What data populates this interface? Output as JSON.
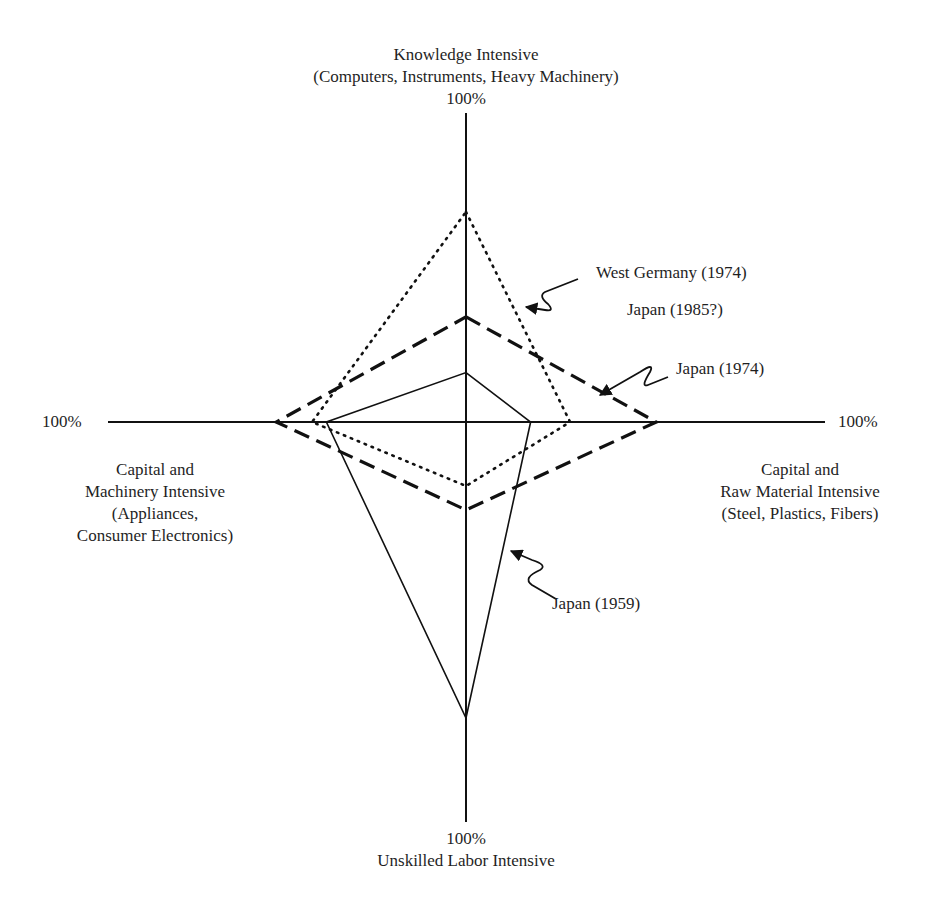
{
  "chart_data": {
    "type": "radar",
    "title": "",
    "axes": [
      {
        "key": "top",
        "name": "Knowledge Intensive",
        "sub": "(Computers, Instruments, Heavy Machinery)",
        "max_label": "100%"
      },
      {
        "key": "right",
        "name": "Capital and Raw Material Intensive",
        "lines": [
          "Capital and",
          "Raw Material Intensive",
          "(Steel, Plastics, Fibers)"
        ],
        "max_label": "100%"
      },
      {
        "key": "bottom",
        "name": "Unskilled Labor Intensive",
        "max_label": "100%"
      },
      {
        "key": "left",
        "name": "Capital and Machinery Intensive",
        "lines": [
          "Capital and",
          "Machinery Intensive",
          "(Appliances,",
          "Consumer Electronics)"
        ],
        "max_label": "100%"
      }
    ],
    "scale": "percent of axis length (0 at center, 100% at axis end)",
    "series": [
      {
        "name": "West Germany (1974) / Japan (1985?)",
        "style": "dotted",
        "values": {
          "top": 68,
          "right": 29,
          "bottom": 16,
          "left": 43
        }
      },
      {
        "name": "Japan (1974)",
        "style": "dashed",
        "values": {
          "top": 34,
          "right": 53,
          "bottom": 22,
          "left": 53
        }
      },
      {
        "name": "Japan (1959)",
        "style": "solid",
        "values": {
          "top": 16,
          "right": 18,
          "bottom": 74,
          "left": 39
        }
      }
    ],
    "annotations": [
      {
        "text": "West Germany (1974)",
        "target_series": 0
      },
      {
        "text": "Japan (1985?)",
        "target_series": 0
      },
      {
        "text": "Japan (1974)",
        "target_series": 1
      },
      {
        "text": "Japan (1959)",
        "target_series": 2
      }
    ],
    "grid": false,
    "legend": "none (callout arrows)"
  },
  "labels": {
    "top_title": "Knowledge Intensive",
    "top_sub": "(Computers, Instruments, Heavy Machinery)",
    "top_pct": "100%",
    "left_pct": "100%",
    "right_pct": "100%",
    "bottom_pct": "100%",
    "bottom_title": "Unskilled Labor Intensive",
    "left_l1": "Capital and",
    "left_l2": "Machinery Intensive",
    "left_l3": "(Appliances,",
    "left_l4": "Consumer Electronics)",
    "right_l1": "Capital and",
    "right_l2": "Raw Material Intensive",
    "right_l3": "(Steel, Plastics, Fibers)",
    "callout_wg": "West Germany (1974)",
    "callout_j85": "Japan (1985?)",
    "callout_j74": "Japan (1974)",
    "callout_j59": "Japan (1959)"
  },
  "colors": {
    "ink": "#111111",
    "background": "#ffffff"
  }
}
